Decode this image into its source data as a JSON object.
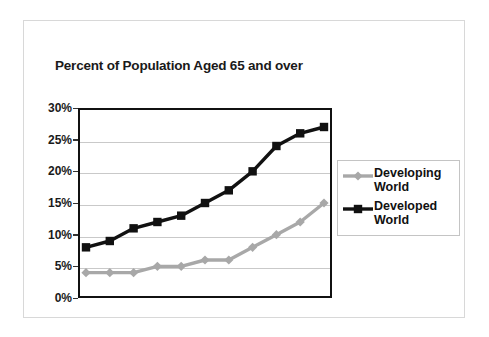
{
  "chart_data": {
    "type": "line",
    "title": "Percent of Population Aged 65 and over",
    "xlabel": "",
    "ylabel": "",
    "ylim": [
      0,
      30
    ],
    "ytick_values": [
      0,
      5,
      10,
      15,
      20,
      25,
      30
    ],
    "ytick_labels": [
      "0%",
      "5%",
      "10%",
      "15%",
      "20%",
      "25%",
      "30%"
    ],
    "xtick_labels": [],
    "grid": "horizontal",
    "legend_position": "right",
    "x": [
      0,
      1,
      2,
      3,
      4,
      5,
      6,
      7,
      8,
      9,
      10
    ],
    "series": [
      {
        "name": "Developing World",
        "color": "#a8a8a8",
        "marker": "diamond",
        "values": [
          4,
          4,
          4,
          5,
          5,
          6,
          6,
          8,
          10,
          12,
          15
        ]
      },
      {
        "name": "Developed World",
        "color": "#111111",
        "marker": "square",
        "values": [
          8,
          9,
          11,
          12,
          13,
          15,
          17,
          20,
          24,
          26,
          27
        ]
      }
    ]
  },
  "legend": {
    "items": [
      {
        "label": "Developing\nWorld",
        "color": "#a8a8a8",
        "marker": "diamond"
      },
      {
        "label": "Developed\nWorld",
        "color": "#111111",
        "marker": "square"
      }
    ]
  },
  "colors": {
    "developing": "#a8a8a8",
    "developed": "#111111",
    "axis": "#111111",
    "gridline": "#c9c9c9",
    "frame": "#d8d8d8",
    "background": "#ffffff",
    "text": "#1a1a1a"
  }
}
